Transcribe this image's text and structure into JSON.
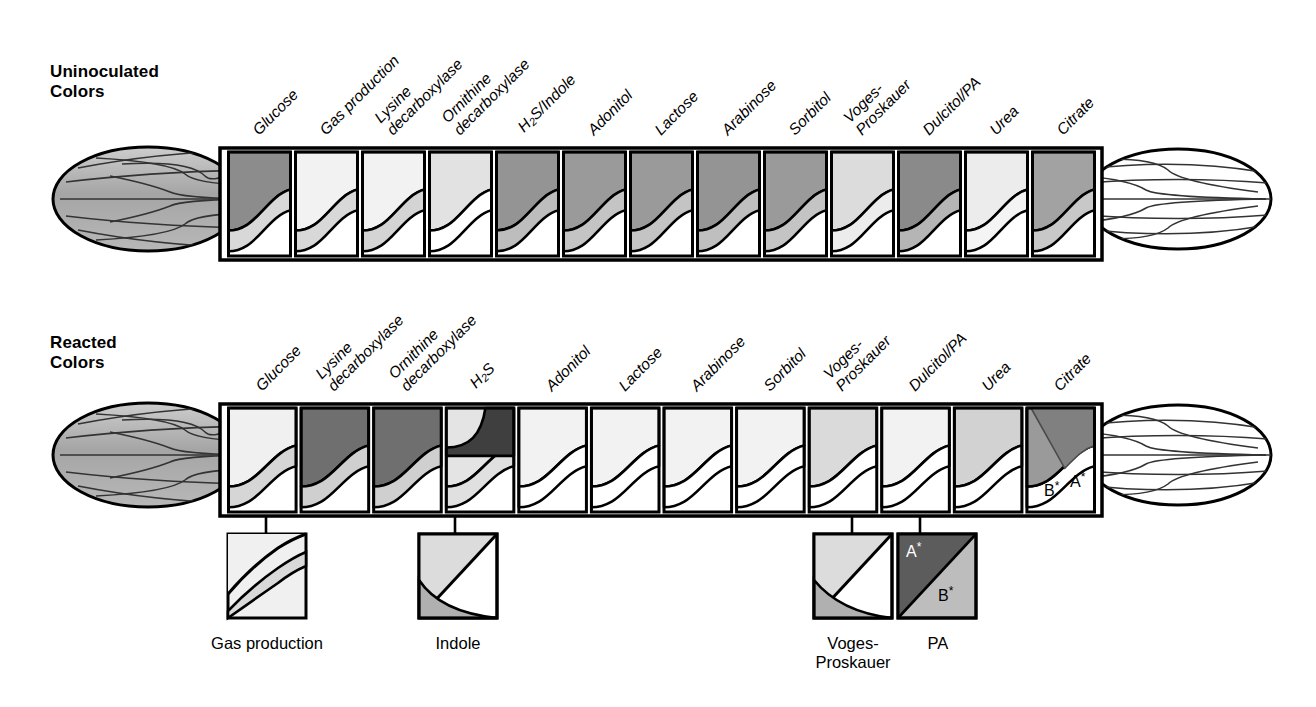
{
  "figure": {
    "rows": [
      {
        "id": "uninoculated",
        "title": "Uninoculated\nColors",
        "compartments": [
          {
            "label": "Glucose",
            "top_shade": "#8c8c8c",
            "mid_shade": "#d8d8d8"
          },
          {
            "label": "Gas production",
            "top_shade": "#f2f2f2",
            "mid_shade": "#d8d8d8"
          },
          {
            "label": "Lysine\ndecarboxylase",
            "top_shade": "#f2f2f2",
            "mid_shade": "#d4d4d4"
          },
          {
            "label": "Ornithine\ndecarboxylase",
            "top_shade": "#e2e2e2",
            "mid_shade": "#ffffff"
          },
          {
            "label": "H2S/Indole",
            "top_shade": "#949494",
            "mid_shade": "#bdbdbd"
          },
          {
            "label": "Adonitol",
            "top_shade": "#9a9a9a",
            "mid_shade": "#c4c4c4"
          },
          {
            "label": "Lactose",
            "top_shade": "#9a9a9a",
            "mid_shade": "#c4c4c4"
          },
          {
            "label": "Arabinose",
            "top_shade": "#949494",
            "mid_shade": "#bfbfbf"
          },
          {
            "label": "Sorbitol",
            "top_shade": "#9a9a9a",
            "mid_shade": "#c4c4c4"
          },
          {
            "label": "Voges-\nProskauer",
            "top_shade": "#dcdcdc",
            "mid_shade": "#ececec"
          },
          {
            "label": "Dulcitol/PA",
            "top_shade": "#8a8a8a",
            "mid_shade": "#b5b5b5"
          },
          {
            "label": "Urea",
            "top_shade": "#ececec",
            "mid_shade": "#f4f4f4"
          },
          {
            "label": "Citrate",
            "top_shade": "#a2a2a2",
            "mid_shade": "#c8c8c8"
          }
        ]
      },
      {
        "id": "reacted",
        "title": "Reacted\nColors",
        "compartments": [
          {
            "label": "Glucose",
            "top_shade": "#f0f0f0",
            "mid_shade": "#d6d6d6"
          },
          {
            "label": "Lysine\ndecarboxylase",
            "top_shade": "#6f6f6f",
            "mid_shade": "#cfcfcf"
          },
          {
            "label": "Ornithine\ndecarboxylase",
            "top_shade": "#6f6f6f",
            "mid_shade": "#cfcfcf"
          },
          {
            "label": "H2S",
            "top_shade": "#e4e4e4",
            "mid_shade": "#e0e0e0"
          },
          {
            "label": "Adonitol",
            "top_shade": "#f2f2f2",
            "mid_shade": "#ffffff"
          },
          {
            "label": "Lactose",
            "top_shade": "#f2f2f2",
            "mid_shade": "#ffffff"
          },
          {
            "label": "Arabinose",
            "top_shade": "#f2f2f2",
            "mid_shade": "#ffffff"
          },
          {
            "label": "Sorbitol",
            "top_shade": "#f2f2f2",
            "mid_shade": "#ffffff"
          },
          {
            "label": "Voges-\nProskauer",
            "top_shade": "#dadada",
            "mid_shade": "#ffffff"
          },
          {
            "label": "Dulcitol/PA",
            "top_shade": "#f2f2f2",
            "mid_shade": "#ffffff"
          },
          {
            "label": "Urea",
            "top_shade": "#d2d2d2",
            "mid_shade": "#ffffff"
          },
          {
            "label": "Citrate",
            "top_shade": "#9a9a9a",
            "mid_shade": "#ffffff"
          }
        ],
        "citrate_tags": {
          "b": "B",
          "a": "A",
          "star": "*"
        }
      }
    ],
    "callouts": [
      {
        "id": "gas-production",
        "label": "Gas production",
        "source_compartment": "Glucose"
      },
      {
        "id": "indole",
        "label": "Indole",
        "source_compartment": "H2S"
      },
      {
        "id": "voges-proskauer",
        "label": "Voges-\nProskauer",
        "source_compartment": "Voges-Proskauer"
      },
      {
        "id": "pa",
        "label": "PA",
        "source_compartment": "Dulcitol/PA",
        "tags": {
          "a": "A",
          "b": "B",
          "star": "*"
        }
      }
    ],
    "colors": {
      "outline": "#000000",
      "cap_fill": "#a8a8a8",
      "cap_fill_light": "#ffffff",
      "background": "#ffffff"
    }
  }
}
